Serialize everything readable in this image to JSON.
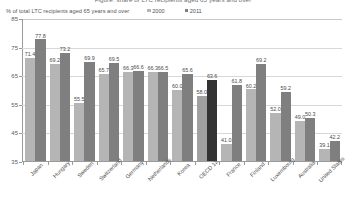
{
  "clipped_title": "Figure: share of LTC recipients aged 65 years and over",
  "subtitle": "% of total LTC recipients aged 65 years and over",
  "legend": {
    "position": "top",
    "items": [
      {
        "label": "2000",
        "color": "#b5b5b5"
      },
      {
        "label": "2011",
        "color": "#7f7f7f"
      }
    ]
  },
  "axis": {
    "y_ticks": [
      "85",
      "75",
      "65",
      "55",
      "45",
      "35"
    ]
  },
  "chart_data": {
    "type": "bar",
    "title": "",
    "subtitle": "% of total LTC recipients aged 65 years and over",
    "xlabel": "",
    "ylabel": "% of total LTC recipients aged 65 years and over",
    "ylim": [
      35,
      85
    ],
    "yticks": [
      35,
      45,
      55,
      65,
      75,
      85
    ],
    "grid": true,
    "legend_position": "top",
    "categories": [
      "Japan",
      "Hungary",
      "Sweden",
      "Switzerland",
      "Germany",
      "Netherlands",
      "Korea",
      "OECD 12",
      "France",
      "Finland",
      "Luxembourg",
      "Australia",
      "United States"
    ],
    "series": [
      {
        "name": "2000",
        "color": "#b5b5b5",
        "values": [
          71.4,
          69.2,
          55.5,
          null,
          66.3,
          66.3,
          60.0,
          null,
          58.0,
          null,
          52.0,
          49.0,
          39.1
        ]
      },
      {
        "name": "2011",
        "color": "#7f7f7f",
        "values": [
          77.8,
          73.2,
          69.9,
          69.5,
          66.6,
          66.5,
          65.6,
          63.6,
          41.0,
          69.2,
          59.2,
          50.3,
          42.2
        ]
      }
    ],
    "bars": [
      {
        "category": "Japan",
        "v2000": 71.4,
        "v2011": 77.8,
        "label2000": "71.4",
        "label2011": "77.8",
        "highlight": false
      },
      {
        "category": "Hungary",
        "v2000": 69.2,
        "v2011": 73.2,
        "label2000": "69.2",
        "label2011": "73.2",
        "highlight": false
      },
      {
        "category": "Sweden",
        "v2000": 55.5,
        "v2011": 69.9,
        "label2000": "55.5",
        "label2011": "69.9",
        "highlight": false
      },
      {
        "category": "Switzerland",
        "v2000": 65.7,
        "v2011": 69.5,
        "label2000": "65.7",
        "label2011": "69.5",
        "highlight": false
      },
      {
        "category": "Germany",
        "v2000": 66.3,
        "v2011": 66.6,
        "label2000": "66.3",
        "label2011": "66.6",
        "highlight": false
      },
      {
        "category": "Netherlands",
        "v2000": 66.3,
        "v2011": 66.5,
        "label2000": "66.3",
        "label2011": "66.5",
        "highlight": false
      },
      {
        "category": "Korea",
        "v2000": 60.0,
        "v2011": 65.6,
        "label2000": "60.0",
        "label2011": "65.6",
        "highlight": false
      },
      {
        "category": "OECD 12",
        "v2000": 58.0,
        "v2011": 63.6,
        "label2000": "58.0",
        "label2011": "63.6",
        "highlight": true
      },
      {
        "category": "France",
        "v2000": 41.0,
        "v2011": 61.8,
        "label2000": "41.0",
        "label2011": "61.8",
        "highlight": false
      },
      {
        "category": "Finland",
        "v2000": 60.2,
        "v2011": 69.2,
        "label2000": "60.2",
        "label2011": "69.2",
        "highlight": false
      },
      {
        "category": "Luxembourg",
        "v2000": 52.0,
        "v2011": 59.2,
        "label2000": "52.0",
        "label2011": "59.2",
        "highlight": false
      },
      {
        "category": "Australia",
        "v2000": 49.0,
        "v2011": 50.3,
        "label2000": "49.0",
        "label2011": "50.3",
        "highlight": false
      },
      {
        "category": "United States",
        "v2000": 39.1,
        "v2011": 42.2,
        "label2000": "39.1",
        "label2011": "42.2",
        "highlight": false
      }
    ]
  }
}
